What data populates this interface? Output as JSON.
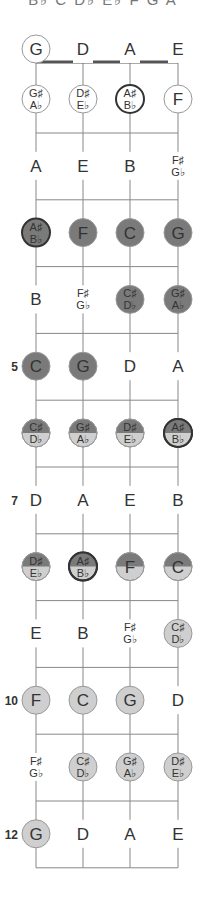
{
  "header": {
    "text": "B♭ C D♭ E♭ F G A"
  },
  "colors": {
    "dark": "#7a7a7a",
    "light": "#cfcfcf",
    "open": "#ffffff",
    "outline": "#999999",
    "ring": "#333333",
    "string": "#888888",
    "nut": "#555555"
  },
  "strings": [
    "G",
    "D",
    "A",
    "E"
  ],
  "fret_markers": [
    {
      "fret": 5,
      "label": "5"
    },
    {
      "fret": 7,
      "label": "7"
    },
    {
      "fret": 10,
      "label": "10"
    },
    {
      "fret": 12,
      "label": "12"
    }
  ],
  "frets": [
    {
      "fret": 0,
      "notes": [
        {
          "sharp": "G",
          "style": "open-circle"
        },
        {
          "sharp": "D",
          "style": "plain"
        },
        {
          "sharp": "A",
          "style": "plain"
        },
        {
          "sharp": "E",
          "style": "plain"
        }
      ]
    },
    {
      "fret": 1,
      "notes": [
        {
          "sharp": "G♯",
          "flat": "A♭",
          "style": "open-circle"
        },
        {
          "sharp": "D♯",
          "flat": "E♭",
          "style": "open-circle"
        },
        {
          "sharp": "A♯",
          "flat": "B♭",
          "style": "open-circle",
          "ring": true
        },
        {
          "sharp": "F",
          "style": "open-circle"
        }
      ]
    },
    {
      "fret": 2,
      "notes": [
        {
          "sharp": "A",
          "style": "plain"
        },
        {
          "sharp": "E",
          "style": "plain"
        },
        {
          "sharp": "B",
          "style": "plain"
        },
        {
          "sharp": "F♯",
          "flat": "G♭",
          "style": "plain"
        }
      ]
    },
    {
      "fret": 3,
      "notes": [
        {
          "sharp": "A♯",
          "flat": "B♭",
          "style": "dark",
          "ring": true
        },
        {
          "sharp": "F",
          "style": "dark"
        },
        {
          "sharp": "C",
          "style": "dark"
        },
        {
          "sharp": "G",
          "style": "dark"
        }
      ]
    },
    {
      "fret": 4,
      "notes": [
        {
          "sharp": "B",
          "style": "plain"
        },
        {
          "sharp": "F♯",
          "flat": "G♭",
          "style": "plain"
        },
        {
          "sharp": "C♯",
          "flat": "D♭",
          "style": "dark"
        },
        {
          "sharp": "G♯",
          "flat": "A♭",
          "style": "dark"
        }
      ]
    },
    {
      "fret": 5,
      "notes": [
        {
          "sharp": "C",
          "style": "dark"
        },
        {
          "sharp": "G",
          "style": "dark"
        },
        {
          "sharp": "D",
          "style": "plain"
        },
        {
          "sharp": "A",
          "style": "plain"
        }
      ]
    },
    {
      "fret": 6,
      "notes": [
        {
          "sharp": "C♯",
          "flat": "D♭",
          "style": "split"
        },
        {
          "sharp": "G♯",
          "flat": "A♭",
          "style": "split"
        },
        {
          "sharp": "D♯",
          "flat": "E♭",
          "style": "split"
        },
        {
          "sharp": "A♯",
          "flat": "B♭",
          "style": "split",
          "ring": true
        }
      ]
    },
    {
      "fret": 7,
      "notes": [
        {
          "sharp": "D",
          "style": "plain"
        },
        {
          "sharp": "A",
          "style": "plain"
        },
        {
          "sharp": "E",
          "style": "plain"
        },
        {
          "sharp": "B",
          "style": "plain"
        }
      ]
    },
    {
      "fret": 8,
      "notes": [
        {
          "sharp": "D♯",
          "flat": "E♭",
          "style": "split"
        },
        {
          "sharp": "A♯",
          "flat": "B♭",
          "style": "split",
          "ring": true
        },
        {
          "sharp": "F",
          "style": "split"
        },
        {
          "sharp": "C",
          "style": "split"
        }
      ]
    },
    {
      "fret": 9,
      "notes": [
        {
          "sharp": "E",
          "style": "plain"
        },
        {
          "sharp": "B",
          "style": "plain"
        },
        {
          "sharp": "F♯",
          "flat": "G♭",
          "style": "plain"
        },
        {
          "sharp": "C♯",
          "flat": "D♭",
          "style": "light"
        }
      ]
    },
    {
      "fret": 10,
      "notes": [
        {
          "sharp": "F",
          "style": "light"
        },
        {
          "sharp": "C",
          "style": "light"
        },
        {
          "sharp": "G",
          "style": "light"
        },
        {
          "sharp": "D",
          "style": "plain"
        }
      ]
    },
    {
      "fret": 11,
      "notes": [
        {
          "sharp": "F♯",
          "flat": "G♭",
          "style": "plain"
        },
        {
          "sharp": "C♯",
          "flat": "D♭",
          "style": "light"
        },
        {
          "sharp": "G♯",
          "flat": "A♭",
          "style": "light"
        },
        {
          "sharp": "D♯",
          "flat": "E♭",
          "style": "light"
        }
      ]
    },
    {
      "fret": 12,
      "notes": [
        {
          "sharp": "G",
          "style": "light"
        },
        {
          "sharp": "D",
          "style": "plain"
        },
        {
          "sharp": "A",
          "style": "plain"
        },
        {
          "sharp": "E",
          "style": "plain"
        }
      ]
    }
  ]
}
